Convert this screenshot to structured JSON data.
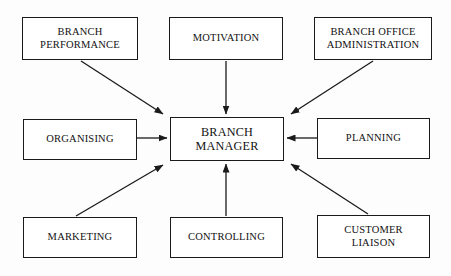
{
  "diagram": {
    "type": "hub-and-spoke",
    "stroke_color": "#1a1a1a",
    "background_color": "#fdfdfd",
    "central_node": {
      "id": "branch-manager",
      "label": "BRANCH\nMANAGER",
      "x": 170,
      "y": 117,
      "width": 114,
      "height": 44
    },
    "peripheral_nodes": [
      {
        "id": "branch-performance",
        "label": "BRANCH\nPERFORMANCE",
        "x": 22,
        "y": 17,
        "width": 116,
        "height": 43,
        "position": "top-left"
      },
      {
        "id": "motivation",
        "label": "MOTIVATION",
        "x": 169,
        "y": 17,
        "width": 114,
        "height": 43,
        "position": "top-center"
      },
      {
        "id": "branch-office-administration",
        "label": "BRANCH OFFICE\nADMINISTRATION",
        "x": 314,
        "y": 17,
        "width": 118,
        "height": 43,
        "position": "top-right"
      },
      {
        "id": "organising",
        "label": "ORGANISING",
        "x": 23,
        "y": 119,
        "width": 114,
        "height": 41,
        "position": "middle-left"
      },
      {
        "id": "planning",
        "label": "PLANNING",
        "x": 317,
        "y": 118,
        "width": 113,
        "height": 41,
        "position": "middle-right"
      },
      {
        "id": "marketing",
        "label": "MARKETING",
        "x": 23,
        "y": 217,
        "width": 114,
        "height": 41,
        "position": "bottom-left"
      },
      {
        "id": "controlling",
        "label": "CONTROLLING",
        "x": 170,
        "y": 217,
        "width": 113,
        "height": 41,
        "position": "bottom-center"
      },
      {
        "id": "customer-liaison",
        "label": "CUSTOMER\nLIAISON",
        "x": 317,
        "y": 215,
        "width": 113,
        "height": 43,
        "position": "bottom-right"
      }
    ],
    "connectors": [
      {
        "id": "branch-performance-to-branch-manager",
        "from": "branch-performance",
        "to": "branch-manager",
        "x1": 81,
        "y1": 61,
        "x2": 163,
        "y2": 114,
        "arrowhead": "end"
      },
      {
        "id": "motivation-to-branch-manager",
        "from": "motivation",
        "to": "branch-manager",
        "x1": 226,
        "y1": 61,
        "x2": 226,
        "y2": 114,
        "arrowhead": "end"
      },
      {
        "id": "branch-office-administration-to-branch-manager",
        "from": "branch-office-administration",
        "to": "branch-manager",
        "x1": 373,
        "y1": 61,
        "x2": 291,
        "y2": 114,
        "arrowhead": "end"
      },
      {
        "id": "organising-to-branch-manager",
        "from": "organising",
        "to": "branch-manager",
        "x1": 137,
        "y1": 138,
        "x2": 167,
        "y2": 138,
        "arrowhead": "end"
      },
      {
        "id": "planning-to-branch-manager",
        "from": "planning",
        "to": "branch-manager",
        "x1": 317,
        "y1": 138,
        "x2": 287,
        "y2": 138,
        "arrowhead": "end"
      },
      {
        "id": "marketing-to-branch-manager",
        "from": "marketing",
        "to": "branch-manager",
        "x1": 76,
        "y1": 216,
        "x2": 163,
        "y2": 165,
        "arrowhead": "end"
      },
      {
        "id": "controlling-to-branch-manager",
        "from": "controlling",
        "to": "branch-manager",
        "x1": 226,
        "y1": 216,
        "x2": 226,
        "y2": 164,
        "arrowhead": "end"
      },
      {
        "id": "customer-liaison-to-branch-manager",
        "from": "customer-liaison",
        "to": "branch-manager",
        "x1": 368,
        "y1": 214,
        "x2": 291,
        "y2": 164,
        "arrowhead": "end"
      }
    ]
  }
}
